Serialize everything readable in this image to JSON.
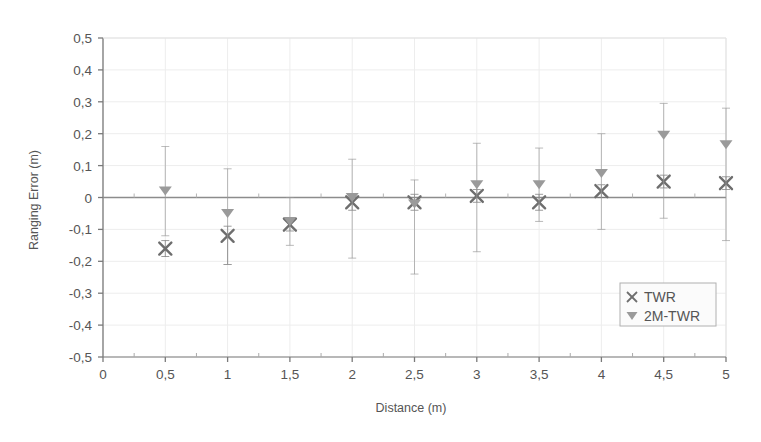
{
  "chart_data": {
    "type": "scatter",
    "title": "",
    "xlabel": "Distance (m)",
    "ylabel": "Ranging Error (m)",
    "xlim": [
      0,
      5
    ],
    "ylim": [
      -0.5,
      0.5
    ],
    "grid": true,
    "legend_position": "bottom-right",
    "x_tick_labels": [
      "0",
      "0,5",
      "1",
      "1,5",
      "2",
      "2,5",
      "3",
      "3,5",
      "4",
      "4,5",
      "5"
    ],
    "x_tick_values": [
      0,
      0.5,
      1,
      1.5,
      2,
      2.5,
      3,
      3.5,
      4,
      4.5,
      5
    ],
    "y_tick_labels": [
      "0,5",
      "0,4",
      "0,3",
      "0,2",
      "0,1",
      "0",
      "-0,1",
      "-0,2",
      "-0,3",
      "-0,4",
      "-0,5"
    ],
    "y_tick_values": [
      0.5,
      0.4,
      0.3,
      0.2,
      0.1,
      0,
      -0.1,
      -0.2,
      -0.3,
      -0.4,
      -0.5
    ],
    "x": [
      0.5,
      1,
      1.5,
      2,
      2.5,
      3,
      3.5,
      4,
      4.5,
      5
    ],
    "series": [
      {
        "name": "TWR",
        "marker": "x",
        "color": "#6e6e6e",
        "values": [
          -0.16,
          -0.12,
          -0.085,
          -0.015,
          -0.015,
          0.005,
          -0.015,
          0.02,
          0.05,
          0.045
        ],
        "err_upper": [
          0.025,
          0.03,
          0.02,
          0.025,
          0.025,
          0.02,
          0.025,
          0.02,
          0.02,
          0.02
        ],
        "err_lower": [
          0.025,
          0.09,
          0.02,
          0.025,
          0.025,
          0.02,
          0.025,
          0.02,
          0.02,
          0.02
        ]
      },
      {
        "name": "2M-TWR",
        "marker": "triangle-down",
        "color": "#9a9a9a",
        "values": [
          0.02,
          -0.05,
          -0.075,
          0.0,
          -0.02,
          0.04,
          0.04,
          0.075,
          0.195,
          0.165
        ],
        "err_upper": [
          0.14,
          0.14,
          0.075,
          0.12,
          0.075,
          0.13,
          0.115,
          0.125,
          0.1,
          0.115
        ],
        "err_lower": [
          0.14,
          0.16,
          0.075,
          0.19,
          0.22,
          0.21,
          0.115,
          0.175,
          0.26,
          0.3
        ]
      }
    ],
    "legend_entries": [
      {
        "label": "TWR",
        "marker": "x",
        "color": "#6e6e6e"
      },
      {
        "label": "2M-TWR",
        "marker": "triangle-down",
        "color": "#9a9a9a"
      }
    ]
  },
  "style": {
    "background": "#ffffff",
    "axis_color": "#7a7a7a",
    "grid_color": "#ededed",
    "zero_line_color": "#8c8c8c",
    "legend_border": "#b0b0b0",
    "legend_background": "#fbfbfb"
  }
}
